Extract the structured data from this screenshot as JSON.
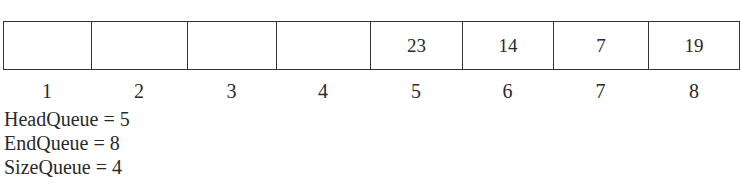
{
  "queue": {
    "cells": [
      {
        "index": "1",
        "value": ""
      },
      {
        "index": "2",
        "value": ""
      },
      {
        "index": "3",
        "value": ""
      },
      {
        "index": "4",
        "value": ""
      },
      {
        "index": "5",
        "value": "23"
      },
      {
        "index": "6",
        "value": "14"
      },
      {
        "index": "7",
        "value": "7"
      },
      {
        "index": "8",
        "value": "19"
      }
    ]
  },
  "variables": [
    {
      "text": "HeadQueue = 5"
    },
    {
      "text": "EndQueue = 8"
    },
    {
      "text": "SizeQueue = 4"
    }
  ]
}
